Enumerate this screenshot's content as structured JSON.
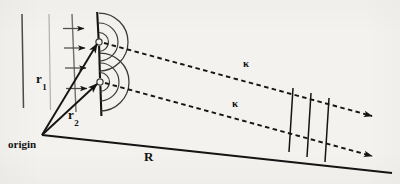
{
  "figure": {
    "domain": "Diagram",
    "kind": "physics-schematic",
    "background_color": "#f3f2ee",
    "ink_color": "#141414",
    "faint_ink_color": "#8d8d8d"
  },
  "labels": {
    "r1": {
      "base": "r",
      "sub": "1"
    },
    "r2": {
      "base": "r",
      "sub": "2"
    },
    "origin": "origin",
    "R": "R",
    "kappa_upper": "κ",
    "kappa_lower": "κ"
  },
  "geometry": {
    "origin_point": {
      "x": 42,
      "y": 135
    },
    "slit_upper": {
      "x": 99,
      "y": 42
    },
    "slit_lower": {
      "x": 99,
      "y": 82
    },
    "barrier": {
      "x_top": 97,
      "y_top": 12,
      "x_bottom": 101,
      "y_bottom": 115
    },
    "wavefront_radii": [
      9,
      18,
      28
    ],
    "wavefront_count_per_slit": 3,
    "incoming_wave_line": {
      "x_top": 72,
      "y_top": 14,
      "x_bottom": 76,
      "y_bottom": 112
    },
    "incoming_arrow_count": 4,
    "reference_line_dark": {
      "x_top": 22,
      "y_top": 14,
      "x_bottom": 23,
      "y_bottom": 108
    },
    "reference_line_faint": {
      "x_top": 49,
      "y_top": 14,
      "x_bottom": 51,
      "y_bottom": 110
    },
    "baseline": {
      "x1": 42,
      "y1": 135,
      "x2": 390,
      "y2": 172
    },
    "detector_line_count": 3
  },
  "elements": {
    "barrier_name": "slit-barrier",
    "upper_ray_name": "outgoing-ray-upper",
    "lower_ray_name": "outgoing-ray-lower"
  }
}
